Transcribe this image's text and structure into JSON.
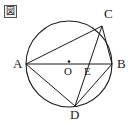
{
  "figure": {
    "caption_marker": "図",
    "caption_marker_name": "figure-marker-kanji",
    "stroke_color": "#1a1a1a",
    "fill_color": "none",
    "background_color": "#ffffff"
  },
  "labels": {
    "A": "A",
    "B": "B",
    "C": "C",
    "D": "D",
    "E": "E",
    "O": "O"
  },
  "geometry": {
    "circle": {
      "center_x": 69,
      "center_y": 64,
      "radius": 43
    },
    "points": {
      "A": {
        "x": 26,
        "y": 64
      },
      "B": {
        "x": 112,
        "y": 64
      },
      "C": {
        "x": 102,
        "y": 26
      },
      "D": {
        "x": 75,
        "y": 106
      },
      "E": {
        "x": 82,
        "y": 64
      },
      "O": {
        "x": 69,
        "y": 64
      }
    },
    "segments": [
      {
        "name": "AB",
        "from": "A",
        "to": "B"
      },
      {
        "name": "AC",
        "from": "A",
        "to": "C"
      },
      {
        "name": "CB",
        "from": "C",
        "to": "B"
      },
      {
        "name": "AD",
        "from": "A",
        "to": "D"
      },
      {
        "name": "DB",
        "from": "D",
        "to": "B"
      },
      {
        "name": "CD",
        "from": "C",
        "to": "D"
      }
    ],
    "center_dot_radius": 1.3
  }
}
